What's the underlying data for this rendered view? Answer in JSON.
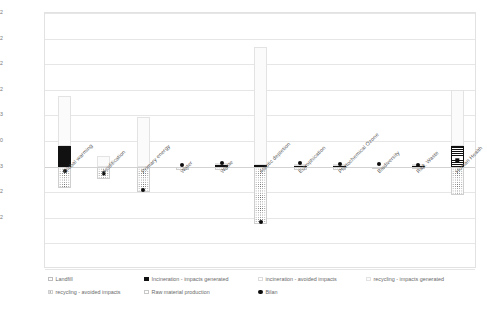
{
  "chart_data": {
    "type": "bar",
    "title": "",
    "subtitle": "",
    "xlabel": "",
    "ylabel": "",
    "grid": true,
    "legend_position": "bottom",
    "ylim": [
      -0.02,
      0.03
    ],
    "ytick_labels": [
      "3E-02",
      "2E-02",
      "2E-02",
      "1E-02",
      "5E-03",
      "0E+00",
      "-5E-03",
      "-1E-02",
      "-2E-02"
    ],
    "ytick_values": [
      0.03,
      0.025,
      0.02,
      0.015,
      0.01,
      0.005,
      0.0,
      -0.005,
      -0.01,
      -0.015,
      -0.02
    ],
    "ygrid_labels": [
      "3E-02",
      "",
      "2E-02",
      "",
      "2E-02",
      "",
      "1E-02",
      "",
      "5E-03",
      "",
      "0E+00",
      "",
      "-5E-03",
      "",
      "-1E-02",
      "",
      "-2E-02"
    ],
    "categories": [
      "Global warming",
      "Acidification",
      "Primary energy",
      "Water",
      "Waste",
      "Abiotic depletion",
      "Eutrophication",
      "Photochemical Ozone",
      "Biodiversity",
      "Rad. Waste",
      "Human Health"
    ],
    "series": [
      {
        "name": "Landfill",
        "values": [
          0.0,
          0.0,
          0.0,
          0.0,
          0.0,
          0.0,
          0.0,
          0.0,
          0.0,
          0.0,
          0.0
        ]
      },
      {
        "name": "Incineration - impacts generated",
        "values": [
          0.004,
          0.0,
          0.0,
          0.0,
          0.0003,
          0.0004,
          0.0002,
          0.0002,
          0.0,
          0.0002,
          0.004
        ]
      },
      {
        "name": "Incineration - avoided impacts",
        "values": [
          0.0,
          0.0,
          0.0,
          0.0,
          0.0,
          0.0,
          0.0,
          0.0,
          0.0,
          0.0,
          0.0
        ]
      },
      {
        "name": "recycling - impacts generated",
        "values": [
          0.0098,
          0.0021,
          0.0097,
          0.0,
          0.0004,
          0.023,
          0.0004,
          0.0003,
          0.0,
          0.0003,
          0.011
        ]
      },
      {
        "name": "recycling - avoided impacts",
        "values": [
          -0.0042,
          -0.0024,
          -0.005,
          -0.0006,
          -0.0006,
          -0.0112,
          -0.0006,
          -0.0006,
          -0.0002,
          -0.0005,
          -0.0055
        ]
      },
      {
        "name": "Raw material production",
        "values": [
          0.0,
          0.0,
          0.0,
          0.0,
          0.0,
          0.0,
          0.0,
          0.0,
          0.0,
          0.0,
          0.0
        ]
      },
      {
        "name": "Bilan",
        "values": [
          -0.0009,
          -0.0013,
          -0.0046,
          0.0004,
          0.0008,
          -0.0108,
          0.0007,
          0.0006,
          0.0005,
          0.0004,
          0.0012
        ]
      }
    ]
  },
  "legend": {
    "row1": [
      {
        "label": "Landfill",
        "swatch": "landfill"
      },
      {
        "label": "Incineration - impacts generated",
        "swatch": "inc-gen"
      },
      {
        "label": "incineration - avoided impacts",
        "swatch": "inc-av"
      },
      {
        "label": "recycling - impacts generated",
        "swatch": "rec-gen"
      }
    ],
    "row2": [
      {
        "label": "recycling - avoided impacts",
        "swatch": "rec-av"
      },
      {
        "label": "Raw material production",
        "swatch": "raw"
      },
      {
        "label": "Bilan",
        "swatch": "bilan"
      }
    ]
  },
  "colors": {
    "axis": "#e2e2e2",
    "grid": "#e6e6e6",
    "marker": "#0d0d0d",
    "text": "#6a6a6a",
    "bar_dark": "#111111",
    "background": "#ffffff"
  }
}
